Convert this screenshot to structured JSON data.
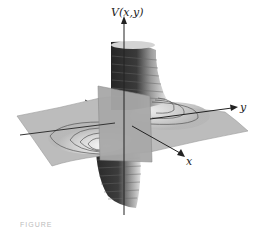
{
  "figure": {
    "axis_labels": {
      "vertical": "V(x,y)",
      "y": "y",
      "x": "x"
    },
    "caption_cropped": "FIGURE"
  },
  "colors": {
    "sheet": "#bdbdbd",
    "sheet_light": "#e8e8e8",
    "spike_dark": "#2e2e2e",
    "spike_light": "#d8d8d8",
    "plane": "#a9a9a9",
    "axis": "#222222",
    "contour": "#555555"
  }
}
